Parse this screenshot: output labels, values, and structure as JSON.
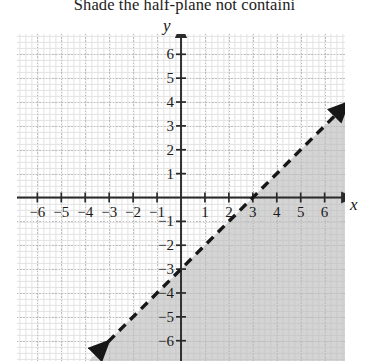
{
  "prompt": {
    "text": "Shade the half-plane not containi"
  },
  "colors": {
    "shade_fill": "#b9b9b9",
    "axis": "#2a2a2a",
    "grid_minor": "#e2e2e2",
    "grid_major": "#bdbdbd",
    "line": "#171717",
    "text": "#1b1b1b",
    "background": "#ffffff"
  },
  "axis_labels": {
    "x": "x",
    "y": "y"
  },
  "chart_data": {
    "type": "line",
    "title": "",
    "subtitle": "",
    "xlabel": "x",
    "ylabel": "y",
    "xlim": [
      -6.85,
      6.85
    ],
    "ylim": [
      -6.85,
      6.85
    ],
    "grid": true,
    "grid_minor_step": 0.25,
    "grid_major_step": 1,
    "legend": "none",
    "xticks": [
      -6,
      -5,
      -4,
      -3,
      -2,
      -1,
      1,
      2,
      3,
      4,
      5,
      6
    ],
    "yticks": [
      -6,
      -5,
      -4,
      -3,
      -2,
      -1,
      1,
      2,
      3,
      4,
      5,
      6
    ],
    "xtick_labels": [
      "−6",
      "−5",
      "−4",
      "−3",
      "−2",
      "−1",
      "1",
      "2",
      "3",
      "4",
      "5",
      "6"
    ],
    "ytick_labels": [
      "−6",
      "−5",
      "−4",
      "−3",
      "−2",
      "−1",
      "1",
      "2",
      "3",
      "4",
      "5",
      "6"
    ],
    "series": [
      {
        "name": "boundary-line",
        "equation": "y = x - 3",
        "slope": 1,
        "intercept": -3,
        "style": "dashed",
        "arrowheads": "both",
        "x_intercept": 3,
        "y_intercept": -3,
        "endpoints": [
          [
            -3.5,
            -6.5
          ],
          [
            6.5,
            3.5
          ]
        ]
      }
    ],
    "shaded_region": {
      "name": "half-plane-below-line",
      "inequality": "y < x - 3",
      "side": "below-right",
      "fill": "#b9b9b9",
      "boundary_included": false
    }
  }
}
